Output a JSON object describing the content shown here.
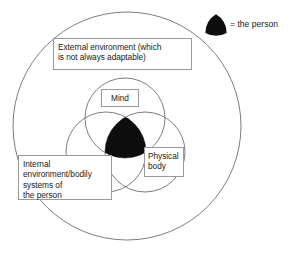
{
  "diagram": {
    "background_color": "#ffffff",
    "stroke_color": "#6f6f6f",
    "person_fill_color": "#0d0d0d",
    "box_border_color": "#9a9a9a",
    "text_color": "#1a1a1a",
    "outer_circle": {
      "name": "external-environment-circle",
      "cx": 127,
      "cy": 126,
      "r": 114
    },
    "circles": [
      {
        "name": "mind-circle",
        "label_key": "mind",
        "cx": 125,
        "cy": 118,
        "r": 40
      },
      {
        "name": "internal-environment-circle",
        "label_key": "internal",
        "cx": 106,
        "cy": 152,
        "r": 40
      },
      {
        "name": "physical-body-circle",
        "label_key": "physical",
        "cx": 145,
        "cy": 152,
        "r": 40
      }
    ],
    "labels": {
      "external": "External environment (which\nis not always adaptable)",
      "mind": "Mind",
      "physical": "Physical\nbody",
      "internal": "Internal\nenvironment/bodily\nsystems of\nthe person"
    }
  },
  "legend": {
    "swatch_icon": "person-marker-icon",
    "text": "= the person"
  }
}
